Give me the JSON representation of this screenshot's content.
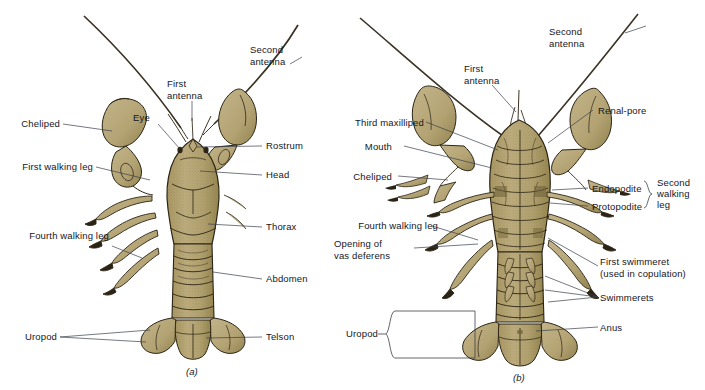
{
  "figure": {
    "background_color": "#ffffff",
    "body_color": "#b5a472",
    "body_shadow_color": "#8d7d4e",
    "outline_color": "#2b2415",
    "text_color": "#16161c",
    "leader_color": "#3a3f4a"
  },
  "panels": [
    {
      "id": "a",
      "caption": "(a)",
      "view": "dorsal",
      "labels": {
        "second_antenna": "Second\nantenna",
        "first_antenna": "First\nantenna",
        "eye": "Eye",
        "cheliped": "Cheliped",
        "first_walking_leg": "First walking leg",
        "fourth_walking_leg": "Fourth walking leg",
        "uropod": "Uropod",
        "rostrum": "Rostrum",
        "head": "Head",
        "thorax": "Thorax",
        "abdomen": "Abdomen",
        "telson": "Telson"
      }
    },
    {
      "id": "b",
      "caption": "(b)",
      "view": "ventral",
      "labels": {
        "second_antenna": "Second\nantenna",
        "first_antenna": "First\nantenna",
        "third_maxilliped": "Third maxilliped",
        "mouth": "Mouth",
        "cheliped": "Cheliped",
        "fourth_walking_leg": "Fourth walking leg",
        "opening_of_vas_deferens": "Opening of\nvas deferens",
        "uropod": "Uropod",
        "renal_pore": "Renal-pore",
        "endopodite": "Endopodite",
        "protopodite": "Protopodite",
        "second_walking_leg": "Second\nwalking\nleg",
        "first_swimmeret": "First swimmeret\n(used in copulation)",
        "swimmerets": "Swimmerets",
        "anus": "Anus"
      }
    }
  ]
}
